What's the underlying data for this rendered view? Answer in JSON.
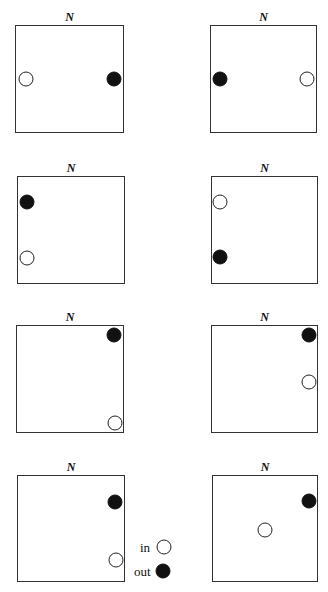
{
  "north_label": "N",
  "colors": {
    "in": "#ffffff",
    "out": "#111111",
    "border": "#333333"
  },
  "legend": {
    "in_label": "in",
    "out_label": "out"
  },
  "panels": [
    {
      "box": [
        15,
        25,
        109,
        108
      ],
      "in": [
        26,
        79
      ],
      "out": [
        114,
        79
      ]
    },
    {
      "box": [
        210,
        25,
        107,
        108
      ],
      "in": [
        307,
        79
      ],
      "out": [
        220,
        79
      ]
    },
    {
      "box": [
        17,
        176,
        108,
        108
      ],
      "in": [
        27,
        258
      ],
      "out": [
        27,
        202
      ]
    },
    {
      "box": [
        211,
        176,
        107,
        108
      ],
      "in": [
        220,
        202
      ],
      "out": [
        220,
        257
      ]
    },
    {
      "box": [
        16,
        325,
        108,
        108
      ],
      "in": [
        115,
        423
      ],
      "out": [
        114,
        335
      ]
    },
    {
      "box": [
        211,
        325,
        107,
        108
      ],
      "in": [
        309,
        382
      ],
      "out": [
        309,
        335
      ]
    },
    {
      "box": [
        17,
        475,
        108,
        107
      ],
      "in": [
        116,
        560
      ],
      "out": [
        115,
        502
      ]
    },
    {
      "box": [
        212,
        475,
        106,
        107
      ],
      "in": [
        265,
        530
      ],
      "out": [
        309,
        501
      ]
    }
  ]
}
